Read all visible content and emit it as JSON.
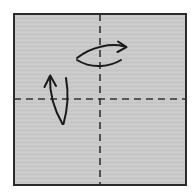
{
  "figure": {
    "title": "Origami step: square sheet with two valley-fold creases",
    "caption": "",
    "type": "origami-instruction-diagram",
    "canvas": {
      "width": 195,
      "height": 192,
      "background_color": "#ffffff"
    }
  },
  "paper": {
    "name": "square-sheet",
    "label": "Square paper sheet",
    "fill_color": "#c9c9c9",
    "stroke_color": "#2b2b2b",
    "stroke_width": 2,
    "x": 14,
    "y": 14,
    "width": 172,
    "height": 171
  },
  "creases": [
    {
      "name": "vertical-crease",
      "label": "Vertical center crease",
      "orientation": "vertical",
      "style": "dashed",
      "color": "#333333",
      "stroke_width": 1.6,
      "dash": "7 5",
      "x1": 100,
      "y1": 14,
      "x2": 100,
      "y2": 185
    },
    {
      "name": "horizontal-crease",
      "label": "Horizontal center crease",
      "orientation": "horizontal",
      "style": "dashed",
      "color": "#333333",
      "stroke_width": 1.6,
      "dash": "7 5",
      "x1": 14,
      "y1": 99,
      "x2": 186,
      "y2": 99
    }
  ],
  "arrows": [
    {
      "name": "fold-right-arrow",
      "label": "Fold right half over vertical crease",
      "direction": "right",
      "color": "#1a1a1a",
      "stroke_width": 2,
      "upper_path": "M 77 58 C 92 46 112 43 124.5 46.5",
      "lower_path": "M 77 60 C 93 70 111 66 121 60",
      "head": "M 118 41.5 L 126.5 47.2 L 117.5 52",
      "tip": {
        "x": 126.5,
        "y": 47.2
      }
    },
    {
      "name": "fold-up-arrow",
      "label": "Fold bottom half up over horizontal crease",
      "direction": "up",
      "color": "#1a1a1a",
      "stroke_width": 2,
      "upper_path": "M 62.5 124 C 54.5 110 49.5 93 50 77.5",
      "lower_path": "M 63.5 124 C 68 108 68.5 92 66 78",
      "head": "M 44.5 87 L 50.2 75.5 L 56 86",
      "tip": {
        "x": 50.2,
        "y": 75.5
      }
    }
  ],
  "colors": {
    "paper_fill": "#c9c9c9",
    "paper_outline": "#2b2b2b",
    "crease_line": "#333333",
    "arrow": "#1a1a1a",
    "background": "#ffffff"
  }
}
